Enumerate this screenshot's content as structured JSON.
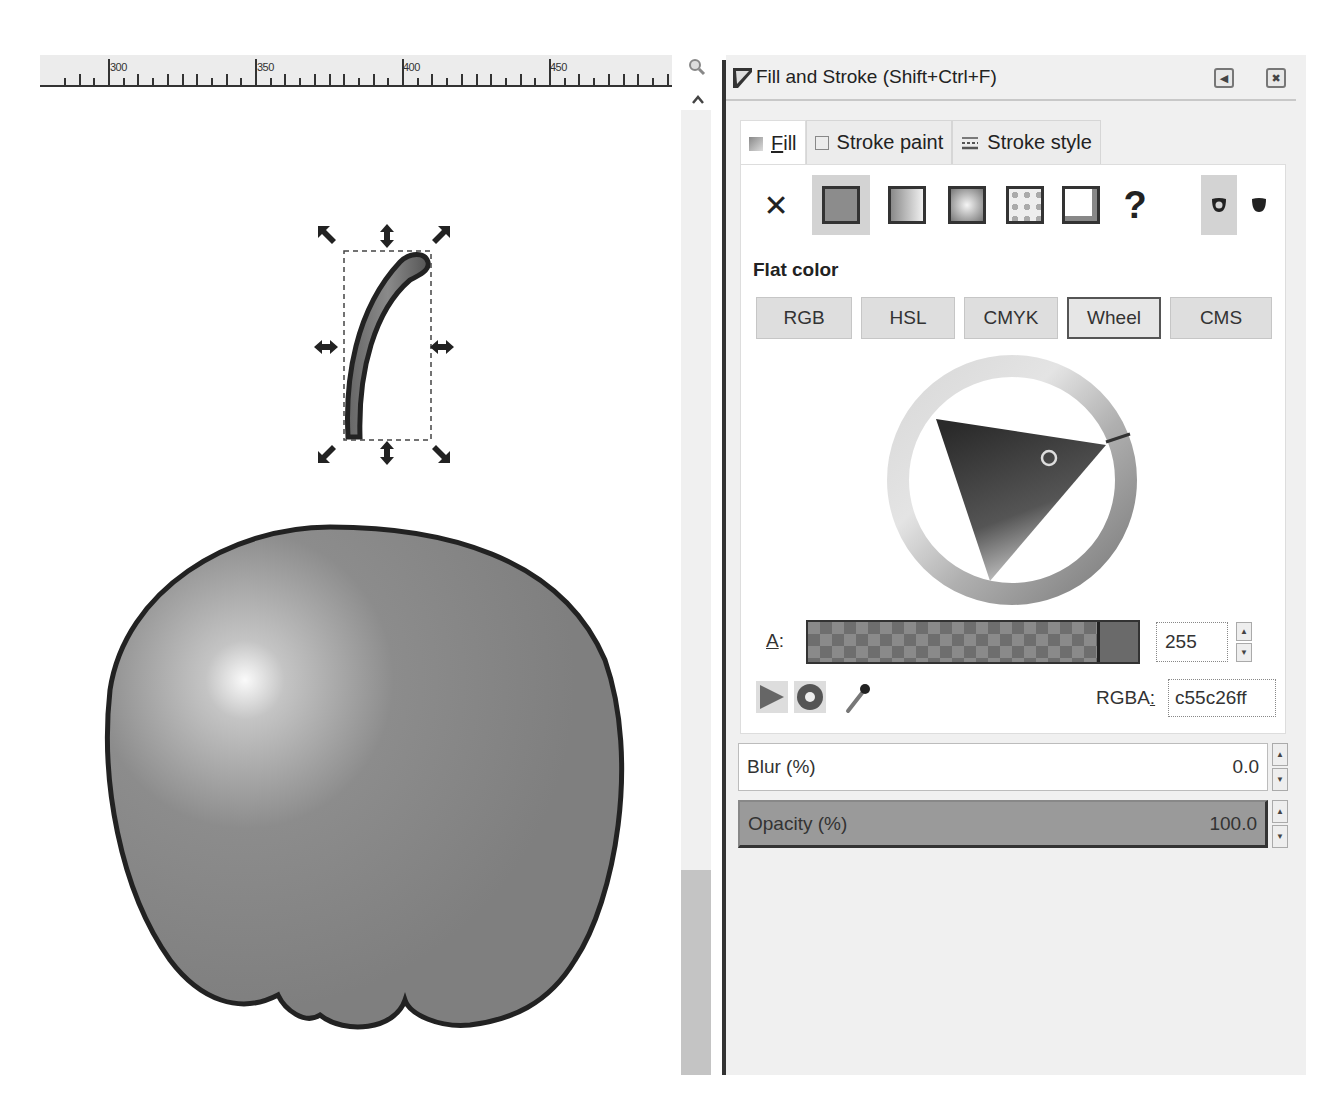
{
  "ruler": {
    "labels": [
      "300",
      "350",
      "400",
      "450"
    ]
  },
  "canvas": {
    "icons": {
      "zoom": "zoom-magnifier-icon",
      "scroll_up": "chevron-up-icon"
    },
    "objects": [
      {
        "name": "apple-stem",
        "selected": true
      },
      {
        "name": "apple-body",
        "selected": false
      }
    ]
  },
  "panel": {
    "title": "Fill and Stroke (Shift+Ctrl+F)",
    "header_icons": [
      "iconify-arrow-icon",
      "close-icon"
    ],
    "tabs": [
      {
        "label_prefix": "",
        "mnemonic": "F",
        "label_rest": "ill",
        "icon": "fill-swatch-icon",
        "active": true
      },
      {
        "label": "Stroke paint",
        "icon": "stroke-paint-icon",
        "active": false
      },
      {
        "label": "Stroke style",
        "icon": "stroke-style-icon",
        "active": false
      }
    ],
    "paint_types": [
      {
        "name": "no-paint",
        "glyph": "✕"
      },
      {
        "name": "flat-color",
        "active": true
      },
      {
        "name": "linear-gradient"
      },
      {
        "name": "radial-gradient"
      },
      {
        "name": "pattern"
      },
      {
        "name": "swatch"
      },
      {
        "name": "unset",
        "glyph": "?"
      }
    ],
    "fill_rules": [
      {
        "name": "evenodd",
        "active": true
      },
      {
        "name": "nonzero",
        "active": false
      }
    ],
    "paint_mode_label": "Flat color",
    "color_modes": [
      {
        "label": "RGB",
        "active": false
      },
      {
        "label": "HSL",
        "active": false
      },
      {
        "label": "CMYK",
        "active": false
      },
      {
        "label": "Wheel",
        "active": true
      },
      {
        "label": "CMS",
        "active": false
      }
    ],
    "alpha": {
      "label_mnemonic": "A",
      "label_rest": ":",
      "value": "255"
    },
    "rgba": {
      "label_prefix": "RGBA",
      "label_mnemonic": ":",
      "value": "c55c26ff"
    },
    "color_tools": [
      "color-managed-icon",
      "out-of-gamut-icon",
      "eyedropper-icon"
    ],
    "blur": {
      "label": "Blur (%)",
      "value": "0.0"
    },
    "opacity": {
      "label": "Opacity (%)",
      "value": "100.0"
    },
    "spin_up": "▲",
    "spin_down": "▼",
    "header_btn_glyphs": [
      "◀",
      "✖"
    ]
  },
  "colors": {
    "current_fill": "#c55c26",
    "canvas_bg": "#ffffff",
    "panel_bg": "#f0f0f0"
  }
}
